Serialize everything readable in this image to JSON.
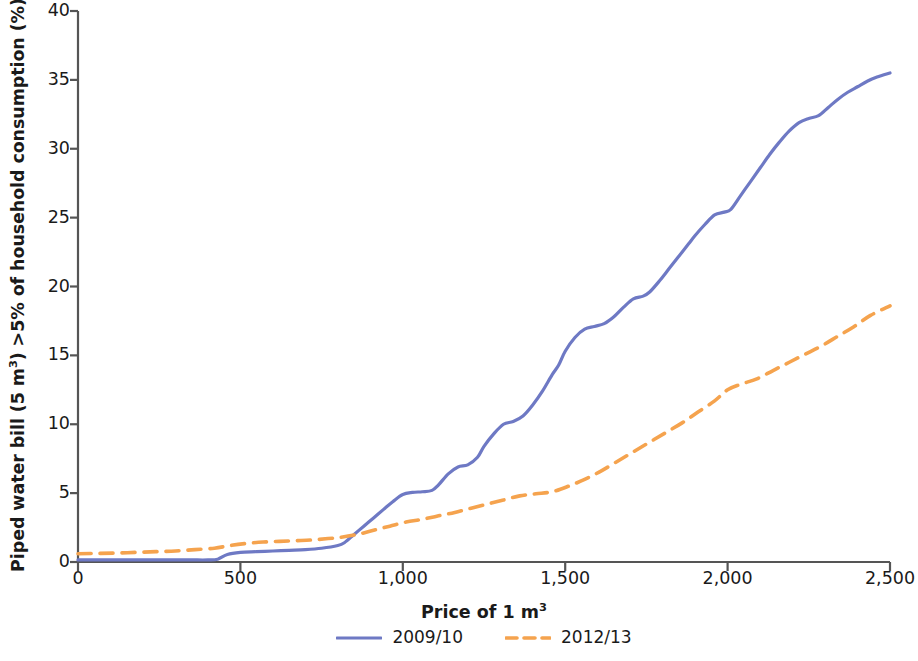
{
  "chart_data": {
    "type": "line",
    "title": "",
    "xlabel": "Price of 1 m³",
    "ylabel": "Piped water bill (5 m³) >5% of household consumption (%)",
    "xlim": [
      0,
      2500
    ],
    "ylim": [
      0,
      40
    ],
    "xticks": [
      0,
      500,
      1000,
      1500,
      2000,
      2500
    ],
    "xtick_labels": [
      "0",
      "500",
      "1,000",
      "1,500",
      "2,000",
      "2,500"
    ],
    "yticks": [
      0,
      5,
      10,
      15,
      20,
      25,
      30,
      35,
      40
    ],
    "ytick_labels": [
      "0",
      "5",
      "10",
      "15",
      "20",
      "25",
      "30",
      "35",
      "40"
    ],
    "grid": false,
    "legend_position": "below",
    "series": [
      {
        "name": "2009/10",
        "color": "#6e79c4",
        "style": "solid",
        "x": [
          0,
          50,
          100,
          150,
          200,
          250,
          300,
          350,
          400,
          430,
          460,
          500,
          550,
          600,
          650,
          700,
          750,
          800,
          820,
          850,
          880,
          910,
          940,
          970,
          1000,
          1030,
          1060,
          1090,
          1110,
          1140,
          1170,
          1200,
          1230,
          1250,
          1280,
          1310,
          1340,
          1370,
          1400,
          1430,
          1460,
          1480,
          1500,
          1530,
          1560,
          1590,
          1620,
          1650,
          1680,
          1710,
          1740,
          1760,
          1790,
          1820,
          1850,
          1880,
          1900,
          1930,
          1960,
          1990,
          2010,
          2040,
          2070,
          2100,
          2130,
          2160,
          2190,
          2220,
          2250,
          2280,
          2310,
          2340,
          2370,
          2400,
          2430,
          2460,
          2500
        ],
        "y": [
          0.15,
          0.15,
          0.15,
          0.15,
          0.15,
          0.15,
          0.15,
          0.15,
          0.15,
          0.2,
          0.55,
          0.7,
          0.75,
          0.8,
          0.85,
          0.9,
          1.0,
          1.2,
          1.4,
          2.0,
          2.6,
          3.2,
          3.8,
          4.4,
          4.9,
          5.05,
          5.1,
          5.2,
          5.6,
          6.4,
          6.9,
          7.05,
          7.6,
          8.4,
          9.3,
          10.0,
          10.2,
          10.6,
          11.4,
          12.4,
          13.6,
          14.3,
          15.3,
          16.3,
          16.9,
          17.1,
          17.3,
          17.8,
          18.5,
          19.1,
          19.3,
          19.6,
          20.4,
          21.3,
          22.2,
          23.1,
          23.7,
          24.5,
          25.2,
          25.4,
          25.6,
          26.6,
          27.6,
          28.6,
          29.6,
          30.5,
          31.3,
          31.9,
          32.2,
          32.4,
          33.0,
          33.6,
          34.1,
          34.5,
          34.9,
          35.2,
          35.5
        ]
      },
      {
        "name": "2012/13",
        "color": "#f5a34e",
        "style": "dashed",
        "x": [
          0,
          60,
          120,
          180,
          240,
          300,
          360,
          420,
          470,
          520,
          570,
          620,
          670,
          720,
          770,
          810,
          860,
          910,
          960,
          1010,
          1060,
          1110,
          1160,
          1210,
          1260,
          1310,
          1360,
          1410,
          1460,
          1510,
          1560,
          1610,
          1660,
          1710,
          1760,
          1810,
          1860,
          1910,
          1960,
          2000,
          2040,
          2090,
          2140,
          2190,
          2240,
          2290,
          2340,
          2390,
          2440,
          2500
        ],
        "y": [
          0.6,
          0.62,
          0.65,
          0.7,
          0.75,
          0.8,
          0.9,
          1.0,
          1.2,
          1.35,
          1.45,
          1.5,
          1.55,
          1.6,
          1.7,
          1.8,
          2.0,
          2.3,
          2.6,
          2.9,
          3.1,
          3.35,
          3.6,
          3.9,
          4.2,
          4.5,
          4.8,
          4.95,
          5.1,
          5.5,
          6.0,
          6.6,
          7.3,
          8.0,
          8.7,
          9.4,
          10.1,
          10.9,
          11.7,
          12.5,
          12.9,
          13.3,
          13.9,
          14.5,
          15.1,
          15.7,
          16.4,
          17.1,
          17.9,
          18.6
        ]
      }
    ]
  },
  "axis": {
    "ylabel_main": "Piped water bill (5 m",
    "ylabel_sup": "3",
    "ylabel_tail": ") >5% of household consumption (%)",
    "xlabel_main": "Price of 1 m",
    "xlabel_sup": "3"
  },
  "legend": {
    "items": [
      {
        "label": "2009/10",
        "color": "#6e79c4",
        "style": "solid"
      },
      {
        "label": "2012/13",
        "color": "#f5a34e",
        "style": "dashed"
      }
    ]
  },
  "colors": {
    "series_2009_10": "#6e79c4",
    "series_2012_13": "#f5a34e",
    "axis": "#555555",
    "text": "#1a1a1a",
    "background": "#ffffff"
  }
}
